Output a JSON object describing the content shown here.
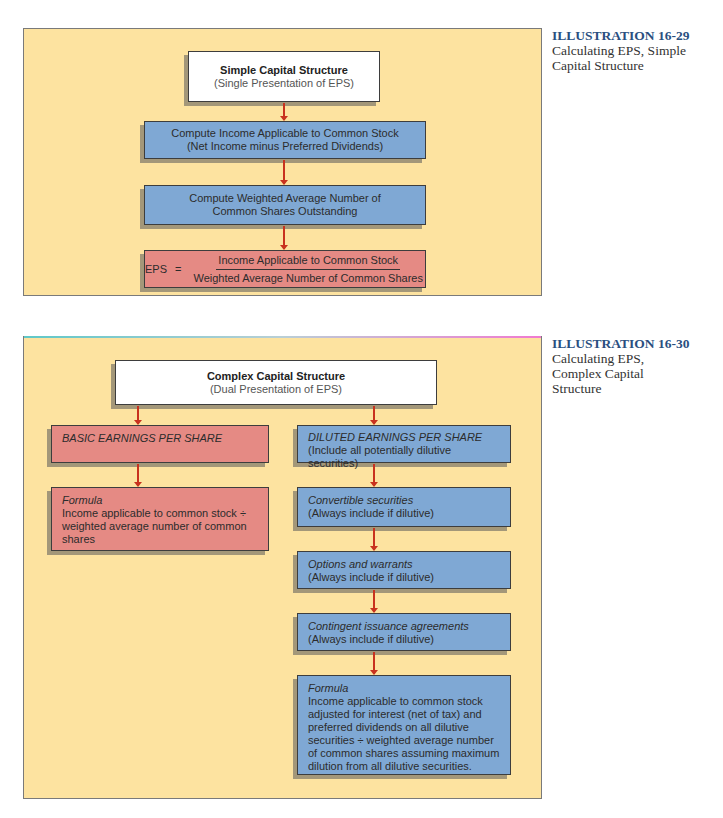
{
  "illustration_1": {
    "number": "ILLUSTRATION 16-29",
    "caption_lines": [
      "Calculating EPS, Simple",
      "Capital Structure"
    ],
    "header_box": {
      "title": "Simple Capital Structure",
      "subtitle": "(Single Presentation of EPS)"
    },
    "steps": [
      {
        "line1": "Compute Income Applicable to Common Stock",
        "line2": "(Net Income minus Preferred Dividends)"
      },
      {
        "line1": "Compute Weighted Average Number of",
        "line2": "Common Shares Outstanding"
      }
    ],
    "formula_box": {
      "lhs": "EPS",
      "equals": "=",
      "numerator": "Income Applicable to Common Stock",
      "denominator": "Weighted Average Number of Common Shares"
    }
  },
  "illustration_2": {
    "number": "ILLUSTRATION 16-30",
    "caption_lines": [
      "Calculating EPS,",
      "Complex Capital",
      "Structure"
    ],
    "header_box": {
      "title": "Complex Capital Structure",
      "subtitle": "(Dual Presentation of EPS)"
    },
    "basic": {
      "title": "BASIC EARNINGS PER SHARE",
      "formula_label": "Formula",
      "formula_lines": [
        "Income applicable to common stock ÷",
        "weighted average number of common",
        "shares"
      ]
    },
    "diluted": {
      "title": "DILUTED EARNINGS PER SHARE",
      "subtitle": "(Include all potentially dilutive securities)",
      "steps": [
        {
          "label": "Convertible securities",
          "note": "(Always include if dilutive)"
        },
        {
          "label": "Options and warrants",
          "note": "(Always include if dilutive)"
        },
        {
          "label": "Contingent issuance agreements",
          "note": "(Always include if dilutive)"
        }
      ],
      "formula_label": "Formula",
      "formula_lines": [
        "Income applicable to common stock",
        "adjusted for interest (net of tax) and",
        "preferred dividends on all dilutive",
        "securities ÷ weighted average number",
        "of common shares assuming maximum",
        "dilution from all dilutive securities."
      ]
    }
  },
  "colors": {
    "panel_bg": "#fde3a0",
    "blue_box": "#7fa8d4",
    "red_box": "#e58a84",
    "arrow": "#c8321e",
    "caption_title": "#2a4f7f"
  }
}
